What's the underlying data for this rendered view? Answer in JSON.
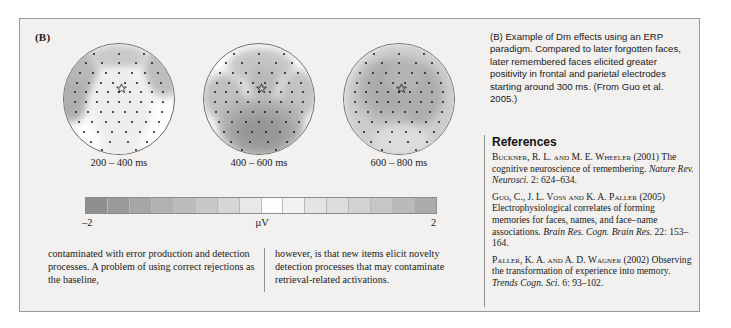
{
  "figure": {
    "panel_label": "(B)",
    "maps": [
      {
        "label": "200 – 400 ms",
        "name": "topomap-200-400"
      },
      {
        "label": "400 – 600 ms",
        "name": "topomap-400-600"
      },
      {
        "label": "600 – 800 ms",
        "name": "topomap-600-800"
      }
    ],
    "colorbar": {
      "min_label": "–2",
      "max_label": "2",
      "unit_label": "µV",
      "cells": 16,
      "colors": [
        "#8f8f8f",
        "#9a9a9a",
        "#a6a6a6",
        "#b1b1b1",
        "#bcbcbc",
        "#c8c8c8",
        "#d6d6d6",
        "#e8e8e8",
        "#fdfdfd",
        "#f2f2f2",
        "#e4e4e4",
        "#dcdcdc",
        "#d2d2d2",
        "#c6c6c6",
        "#bababa",
        "#ababab"
      ]
    }
  },
  "caption": {
    "text": "(B) Example of Dm effects using an ERP paradigm. Compared to later forgotten faces, later remembered faces elicited greater positivity in frontal and parietal electrodes starting around 300 ms. (From Guo et al. 2005.)"
  },
  "body": {
    "column_left": "contaminated with error production and detection processes. A problem of using correct rejections as the baseline,",
    "column_right": "however, is that new items elicit novelty detection processes that may contaminate retrieval-related activations."
  },
  "references": {
    "heading": "References",
    "items": [
      {
        "authors": "Buckner, R. L. and M. E. Wheeler",
        "year": "(2001)",
        "title": "The cognitive neuroscience of remembering.",
        "journal": "Nature Rev. Neurosci.",
        "locator": "2: 624–634."
      },
      {
        "authors": "Guo, C., J. L. Voss and K. A. Paller",
        "year": "(2005)",
        "title": "Electrophysiological correlates of forming memories for faces, names, and face–name associations.",
        "journal": "Brain Res. Cogn. Brain Res.",
        "locator": "22: 153–164."
      },
      {
        "authors": "Paller, K. A. and A. D. Wagner",
        "year": "(2002)",
        "title": "Observing the transformation of experience into memory.",
        "journal": "Trends Cogn. Sci.",
        "locator": "6: 93–102."
      }
    ]
  },
  "chart_data": {
    "type": "heatmap",
    "unit": "µV",
    "colorscale": {
      "min": -2,
      "max": 2,
      "label": "µV",
      "steps": 16
    },
    "panels": [
      {
        "name": "200 – 400 ms",
        "window_ms": [
          200,
          400
        ],
        "description": "Mostly near-zero scalp distribution; weak mid-gray at lateral temporal edges and a faint central positive band.",
        "blobs": [
          {
            "cx": 10,
            "cy": 26,
            "rx": 22,
            "ry": 26,
            "value": -0.9,
            "color": "#b8b8b8"
          },
          {
            "cx": 92,
            "cy": 24,
            "rx": 20,
            "ry": 24,
            "value": -0.9,
            "color": "#bdbdbd"
          },
          {
            "cx": 6,
            "cy": 52,
            "rx": 16,
            "ry": 20,
            "value": -1.2,
            "color": "#aeaeae"
          },
          {
            "cx": 50,
            "cy": 12,
            "rx": 26,
            "ry": 12,
            "value": -0.6,
            "color": "#c9c9c9"
          },
          {
            "cx": 52,
            "cy": 58,
            "rx": 28,
            "ry": 36,
            "value": 0.5,
            "color": "#ededed"
          },
          {
            "cx": 52,
            "cy": 92,
            "rx": 18,
            "ry": 16,
            "value": 0.4,
            "color": "#eeeeee"
          }
        ]
      },
      {
        "name": "400 – 600 ms",
        "window_ms": [
          400,
          600
        ],
        "description": "Strong posterior/parietal negativity shown as a large dark-gray blob over centro-parietal sites, with a mid frontal band.",
        "blobs": [
          {
            "cx": 52,
            "cy": 20,
            "rx": 30,
            "ry": 16,
            "value": -0.8,
            "color": "#c6c6c6"
          },
          {
            "cx": 54,
            "cy": 36,
            "rx": 14,
            "ry": 16,
            "value": -1.1,
            "color": "#b9b9b9"
          },
          {
            "cx": 18,
            "cy": 48,
            "rx": 20,
            "ry": 22,
            "value": -0.9,
            "color": "#c0c0c0"
          },
          {
            "cx": 86,
            "cy": 46,
            "rx": 18,
            "ry": 22,
            "value": -0.9,
            "color": "#c2c2c2"
          },
          {
            "cx": 52,
            "cy": 74,
            "rx": 40,
            "ry": 28,
            "value": -1.3,
            "color": "#b2b2b2"
          },
          {
            "cx": 52,
            "cy": 78,
            "rx": 30,
            "ry": 21,
            "value": -1.6,
            "color": "#a2a2a2"
          },
          {
            "cx": 52,
            "cy": 80,
            "rx": 20,
            "ry": 14,
            "value": -1.9,
            "color": "#969696"
          }
        ]
      },
      {
        "name": "600 – 800 ms",
        "window_ms": [
          600,
          800
        ],
        "description": "Broad mid-gray negativity covering most of the scalp with a darker fronto-central / right-central band.",
        "blobs": [
          {
            "cx": 52,
            "cy": 52,
            "rx": 54,
            "ry": 54,
            "value": -0.7,
            "color": "#cdcdcd"
          },
          {
            "cx": 50,
            "cy": 44,
            "rx": 40,
            "ry": 32,
            "value": -1.1,
            "color": "#bbbbbb"
          },
          {
            "cx": 40,
            "cy": 40,
            "rx": 22,
            "ry": 24,
            "value": -1.4,
            "color": "#ababab"
          },
          {
            "cx": 68,
            "cy": 46,
            "rx": 20,
            "ry": 26,
            "value": -1.4,
            "color": "#adadad"
          },
          {
            "cx": 54,
            "cy": 30,
            "rx": 16,
            "ry": 14,
            "value": -1.2,
            "color": "#b5b5b5"
          },
          {
            "cx": 52,
            "cy": 88,
            "rx": 26,
            "ry": 14,
            "value": -0.5,
            "color": "#dcdcdc"
          }
        ]
      }
    ],
    "electrode_marker": {
      "symbol": "star",
      "meaning": "highlighted electrode site",
      "x_pct": 52,
      "y_pct": 40
    }
  }
}
